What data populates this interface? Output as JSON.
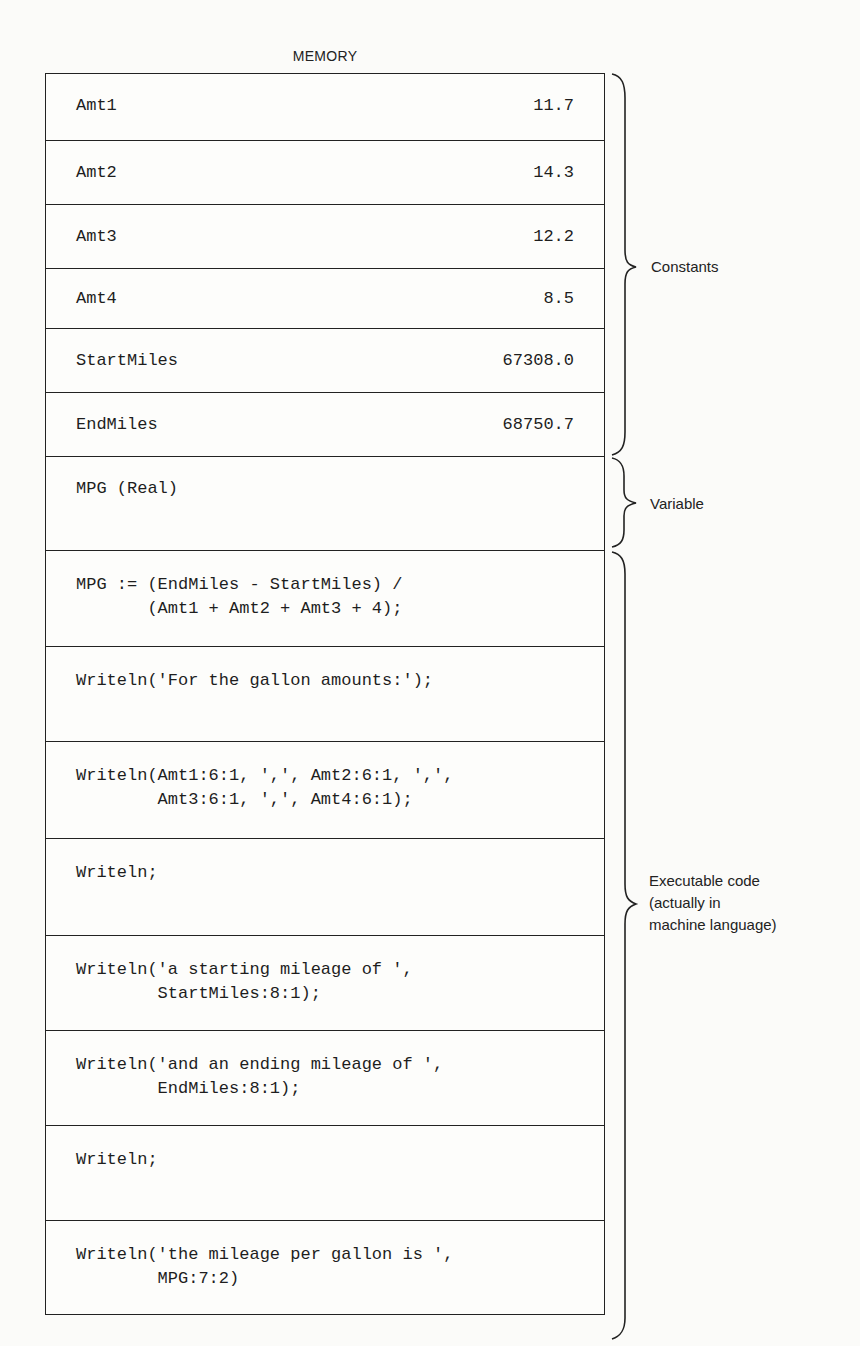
{
  "diagram": {
    "title": "MEMORY",
    "constants": [
      {
        "name": "Amt1",
        "value": "11.7"
      },
      {
        "name": "Amt2",
        "value": "14.3"
      },
      {
        "name": "Amt3",
        "value": "12.2"
      },
      {
        "name": "Amt4",
        "value": "8.5"
      },
      {
        "name": "StartMiles",
        "value": "67308.0"
      },
      {
        "name": "EndMiles",
        "value": "68750.7"
      }
    ],
    "variable": {
      "name": "MPG (Real)"
    },
    "code": [
      {
        "text": "MPG := (EndMiles - StartMiles) /\n       (Amt1 + Amt2 + Amt3 + 4);"
      },
      {
        "text": "Writeln('For the gallon amounts:');"
      },
      {
        "text": "Writeln(Amt1:6:1, ',', Amt2:6:1, ',',\n        Amt3:6:1, ',', Amt4:6:1);"
      },
      {
        "text": "Writeln;"
      },
      {
        "text": "Writeln('a starting mileage of ',\n        StartMiles:8:1);"
      },
      {
        "text": "Writeln('and an ending mileage of ',\n        EndMiles:8:1);"
      },
      {
        "text": "Writeln;"
      },
      {
        "text": "Writeln('the mileage per gallon is ',\n        MPG:7:2)"
      }
    ],
    "labels": {
      "constants": "Constants",
      "variable": "Variable",
      "executable_line1": "Executable code",
      "executable_line2": "(actually in",
      "executable_line3": "machine language)"
    }
  }
}
